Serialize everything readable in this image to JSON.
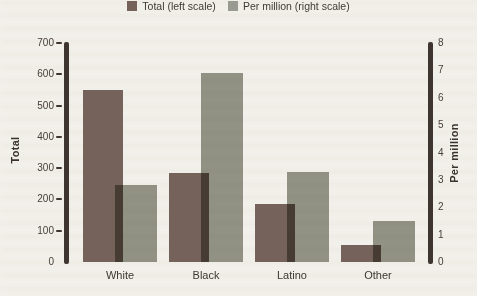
{
  "figure": {
    "kind": "printed book chart",
    "background_color": "#f2f0ea",
    "axis_color": "#3e3530",
    "text_color": "#46403a"
  },
  "chart_data": {
    "type": "bar",
    "categories": [
      "White",
      "Black",
      "Latino",
      "Other"
    ],
    "series": [
      {
        "name": "Total (left scale)",
        "axis": "left",
        "color": "#75625b",
        "values": [
          550,
          285,
          185,
          55
        ]
      },
      {
        "name": "Per million (right scale)",
        "axis": "right",
        "color": "#999b90",
        "values": [
          2.8,
          6.9,
          3.3,
          1.5
        ]
      }
    ],
    "left_axis": {
      "label": "Total",
      "min": 0,
      "max": 700,
      "tick_step": 100,
      "ticks": [
        0,
        100,
        200,
        300,
        400,
        500,
        600,
        700
      ]
    },
    "right_axis": {
      "label": "Per million",
      "min": 0,
      "max": 8,
      "tick_step": 1,
      "ticks": [
        0,
        1,
        2,
        3,
        4,
        5,
        6,
        7,
        8
      ]
    },
    "legend_position": "top",
    "grid": false,
    "bar_overlap": "per-million bars overlap total bars and darken (multiply)"
  }
}
